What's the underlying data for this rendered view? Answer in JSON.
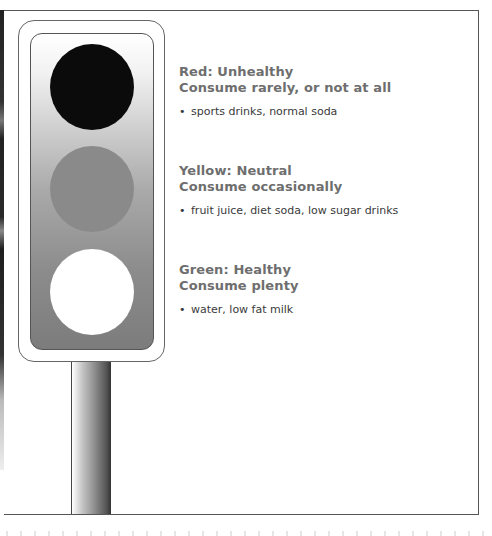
{
  "traffic_light": {
    "lamps": [
      {
        "name": "red",
        "rendered_color": "#0b0b0b"
      },
      {
        "name": "yellow",
        "rendered_color": "#8a8a8a"
      },
      {
        "name": "green",
        "rendered_color": "#ffffff"
      }
    ]
  },
  "categories": [
    {
      "title": "Red: Unhealthy",
      "subtitle": "Consume rarely, or not at all",
      "bullet": "•",
      "items": "sports drinks, normal soda"
    },
    {
      "title": "Yellow: Neutral",
      "subtitle": "Consume occasionally",
      "bullet": "•",
      "items": "fruit juice, diet soda, low sugar drinks"
    },
    {
      "title": "Green: Healthy",
      "subtitle": "Consume plenty",
      "bullet": "•",
      "items": "water, low fat milk"
    }
  ],
  "colors": {
    "heading_text": "#6e6e6e",
    "body_text": "#3a3a3a",
    "frame": "#555555"
  }
}
